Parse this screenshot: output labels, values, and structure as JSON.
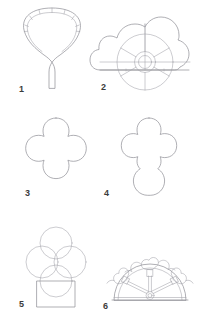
{
  "plate": {
    "title": "Plate of six architectural tracery and vault forms",
    "background_color": "#ffffff",
    "line_color": "#8d8d93",
    "label_color": "#3c3c3c",
    "width": 206,
    "height": 325,
    "figures": [
      {
        "number": "1",
        "name": "fan-vault-shell",
        "description": "Fan or shell shaped vault springing from a slender conical stem, the outer arc divided into radiating voussoir segments by short cross joints",
        "label_position": {
          "x": 19,
          "y": 85
        },
        "segments": 8
      },
      {
        "number": "2",
        "name": "cusped-wheel-tracery",
        "description": "Cloud-like multifoil outline enclosing a wheel with concentric rings, a small central hub and six radiating spokes",
        "label_position": {
          "x": 101,
          "y": 83
        },
        "lobes": 5,
        "spokes": 6
      },
      {
        "number": "3",
        "name": "quatrefoil",
        "description": "Four-lobed quatrefoil with pointed cusps between the lobes",
        "label_position": {
          "x": 25,
          "y": 189
        },
        "lobes": 4
      },
      {
        "number": "4",
        "name": "vertical-trefoil-panel",
        "description": "Upright foiled panel, a quatrefoil head above an elongated rounded lower lobe",
        "label_position": {
          "x": 104,
          "y": 189
        },
        "lobes": 5
      },
      {
        "number": "5",
        "name": "trefoil-construction-circles",
        "description": "Geometric construction of a trefoil from four overlapping circles set on a rectangular plinth",
        "label_position": {
          "x": 19,
          "y": 300
        },
        "circles": 4
      },
      {
        "number": "6",
        "name": "semicircular-fanlight-tracery",
        "description": "Semicircular tympanum or fanlight with three radiating arms of cusped foliate tracery rising from a small hub on the sill",
        "label_position": {
          "x": 103,
          "y": 302
        },
        "arms": 3
      }
    ]
  }
}
